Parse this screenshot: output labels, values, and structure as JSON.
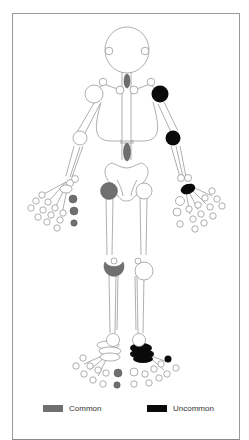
{
  "figure": {
    "type": "skeletal-joint-involvement-diagram",
    "colors": {
      "common": "#6f6f6f",
      "uncommon": "#0a0a0a",
      "unaffected": "#ffffff",
      "outline": "#8c8c8c"
    }
  },
  "legend": {
    "items": [
      {
        "label": "Common",
        "color": "#6f6f6f"
      },
      {
        "label": "Uncommon",
        "color": "#0a0a0a"
      }
    ]
  },
  "joints": {
    "common": [
      "cervical-spine",
      "lumbar-spine",
      "right-hip",
      "right-knee",
      "right-hand-digit-5-mcp",
      "right-hand-digit-5-pip",
      "right-hand-digit-5-dip",
      "right-foot-digit-1-mtp",
      "right-foot-digit-1-ip"
    ],
    "uncommon": [
      "left-shoulder",
      "left-elbow",
      "left-wrist",
      "left-tarsus",
      "left-foot-digit-5-mtp"
    ]
  }
}
